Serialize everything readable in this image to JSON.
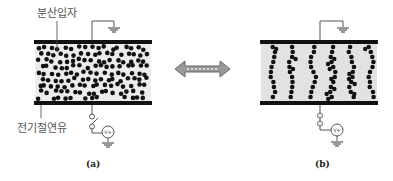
{
  "labels": {
    "dispersed_particles": "분산입자",
    "insulating_oil": "전기절연유",
    "voltage_source": "V+",
    "caption_a": "(a)",
    "caption_b": "(b)"
  },
  "panels": [
    {
      "id": "a",
      "state": "no field — particles randomly dispersed",
      "switch": "open"
    },
    {
      "id": "b",
      "state": "field applied — particles form chains between electrodes",
      "switch": "closed",
      "chain_count": 6
    }
  ],
  "colors": {
    "plate": "#111111",
    "fluid_a": "#ececec",
    "fluid_b": "#e2e2e2",
    "particle": "#111111",
    "wire": "#555555",
    "arrow": "#888888"
  }
}
